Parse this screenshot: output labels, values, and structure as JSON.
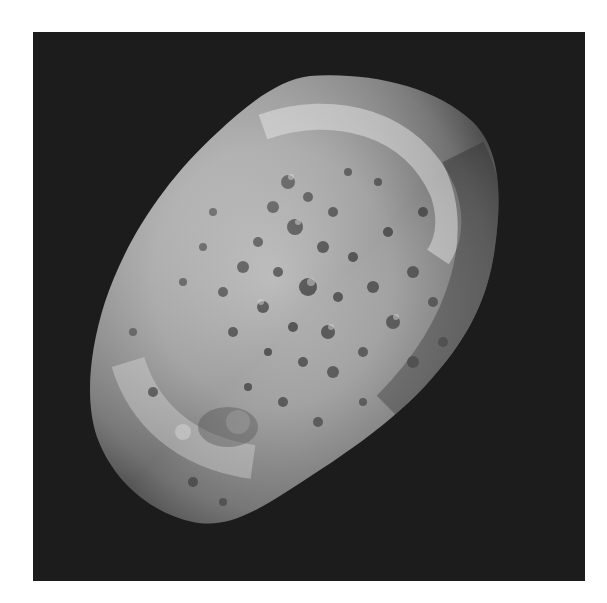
{
  "image": {
    "subject": "cratered irregular moon on black space background",
    "style": "grayscale",
    "background_color": "#1c1c1c",
    "page_color": "#ffffff",
    "surface_colors": {
      "highlight": "#d8d8d8",
      "mid": "#9a9a9a",
      "shadow": "#4a4a4a",
      "crater": "#3a3a3a"
    }
  }
}
